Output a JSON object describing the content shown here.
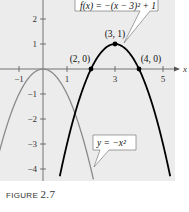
{
  "chart_data": {
    "type": "line",
    "title": "",
    "xlabel": "x",
    "ylabel": "",
    "xlim": [
      -1.8,
      5.5
    ],
    "ylim": [
      -4.5,
      2.8
    ],
    "x_ticks": [
      "-1",
      "1",
      "3",
      "5"
    ],
    "y_ticks": [
      "2",
      "1",
      "-1",
      "-2",
      "-3",
      "-4"
    ],
    "grid": false,
    "series": [
      {
        "name": "f(x) = -(x - 3)^2 + 1",
        "color": "#000000",
        "style": "thick",
        "formula": "-(x-3)^2+1"
      },
      {
        "name": "y = -x^2",
        "color": "#8a8a8a",
        "style": "normal",
        "formula": "-x^2"
      }
    ],
    "points": [
      {
        "x": 3,
        "y": 1,
        "label": "(3, 1)"
      },
      {
        "x": 2,
        "y": 0,
        "label": "(2, 0)"
      },
      {
        "x": 4,
        "y": 0,
        "label": "(4, 0)"
      }
    ],
    "annotations": [
      {
        "text": "f(x) = −(x − 3)² + 1",
        "target": "f"
      },
      {
        "text": "y = −x²",
        "target": "g"
      }
    ]
  },
  "caption": {
    "label": "FIGURE",
    "number": "2.7"
  }
}
